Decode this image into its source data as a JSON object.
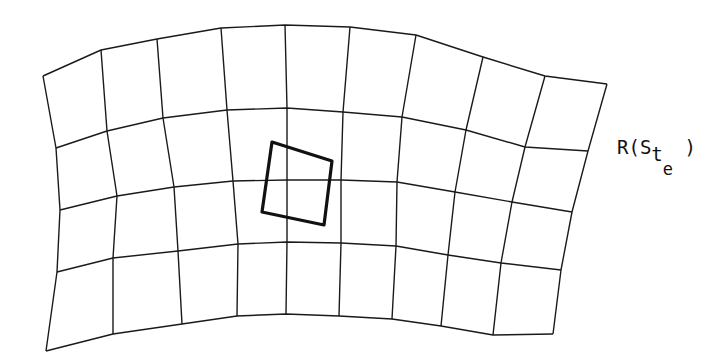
{
  "diagram": {
    "label": {
      "prefix": "R(S",
      "sub": "t",
      "subsub": "e",
      "suffix": " )"
    },
    "colors": {
      "ink": "#1a1a1a",
      "background": "#ffffff"
    },
    "grid": {
      "rows": 4,
      "cols": 9,
      "nodes": [
        [
          [
            43,
            76
          ],
          [
            101,
            50
          ],
          [
            157,
            39
          ],
          [
            221,
            28
          ],
          [
            285,
            25
          ],
          [
            350,
            27
          ],
          [
            416,
            35
          ],
          [
            483,
            57
          ],
          [
            545,
            76
          ],
          [
            607,
            84
          ]
        ],
        [
          [
            56,
            148
          ],
          [
            107,
            131
          ],
          [
            163,
            118
          ],
          [
            227,
            110
          ],
          [
            287,
            108
          ],
          [
            343,
            112
          ],
          [
            402,
            117
          ],
          [
            466,
            130
          ],
          [
            525,
            147
          ],
          [
            588,
            151
          ]
        ],
        [
          [
            60,
            210
          ],
          [
            117,
            196
          ],
          [
            174,
            187
          ],
          [
            233,
            181
          ],
          [
            287,
            180
          ],
          [
            341,
            180
          ],
          [
            397,
            182
          ],
          [
            455,
            192
          ],
          [
            512,
            202
          ],
          [
            572,
            212
          ]
        ],
        [
          [
            57,
            272
          ],
          [
            113,
            258
          ],
          [
            178,
            251
          ],
          [
            238,
            244
          ],
          [
            287,
            242
          ],
          [
            341,
            243
          ],
          [
            396,
            246
          ],
          [
            448,
            255
          ],
          [
            501,
            263
          ],
          [
            561,
            270
          ]
        ],
        [
          [
            46,
            351
          ],
          [
            113,
            334
          ],
          [
            182,
            324
          ],
          [
            237,
            316
          ],
          [
            286,
            314
          ],
          [
            339,
            316
          ],
          [
            392,
            319
          ],
          [
            441,
            326
          ],
          [
            493,
            335
          ],
          [
            553,
            334
          ]
        ]
      ]
    },
    "highlighted_cell": {
      "corners": [
        [
          272,
          142
        ],
        [
          332,
          161
        ],
        [
          324,
          225
        ],
        [
          262,
          212
        ]
      ]
    }
  }
}
